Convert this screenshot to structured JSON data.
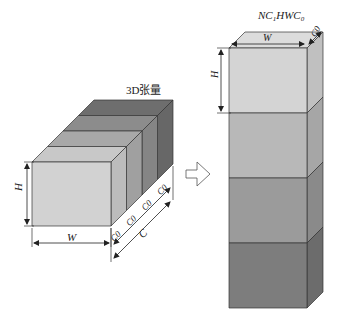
{
  "left_figure": {
    "title": "3D张量",
    "height_label": "H",
    "width_label": "W",
    "channel_label": "C",
    "slice_labels": [
      "C0",
      "C0",
      "C0",
      "C0"
    ],
    "slice_colors": {
      "front": [
        "#d2d2d2",
        "#bdbdbd",
        "#9e9e9e",
        "#7c7c7c"
      ],
      "top": [
        "#c8c8c8",
        "#a8a8a8",
        "#8c8c8c",
        "#6e6e6e"
      ],
      "side": [
        "#bcbcbc",
        "#a0a0a0",
        "#858585",
        "#676767"
      ]
    }
  },
  "arrow": {
    "direction": "right"
  },
  "right_figure": {
    "title": "NC1HWC0",
    "title_parts": {
      "prefix": "NC",
      "sub1": "1",
      "mid": "HWC",
      "sub2": "0"
    },
    "height_label": "H",
    "width_label": "W",
    "depth_label": "C0",
    "blocks": [
      {
        "front": "#d4d4d4",
        "side": "#c0c0c0"
      },
      {
        "front": "#b8b8b8",
        "side": "#a6a6a6"
      },
      {
        "front": "#9b9b9b",
        "side": "#8a8a8a"
      },
      {
        "front": "#7d7d7d",
        "side": "#6c6c6c"
      }
    ]
  }
}
